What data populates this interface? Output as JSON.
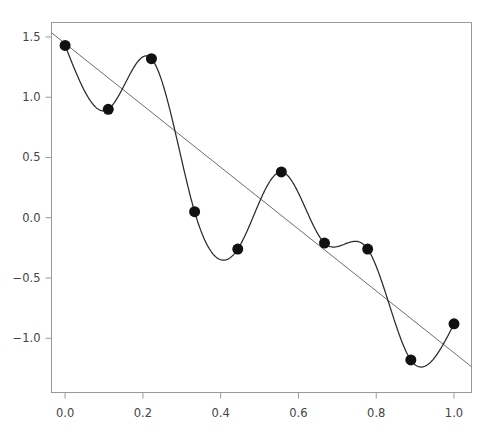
{
  "chart_data": {
    "type": "scatter",
    "title": "",
    "subtitle": "",
    "xlabel": "",
    "ylabel": "",
    "xlim": [
      -0.035,
      1.045
    ],
    "ylim": [
      -1.45,
      1.62
    ],
    "grid": false,
    "legend": false,
    "x_ticks": [
      "0.0",
      "0.2",
      "0.4",
      "0.6",
      "0.8",
      "1.0"
    ],
    "x_tick_values": [
      0.0,
      0.2,
      0.4,
      0.6,
      0.8,
      1.0
    ],
    "y_ticks": [
      "1.5",
      "1.0",
      "0.5",
      "0.0",
      "-0.5",
      "-1.0"
    ],
    "y_tick_values": [
      1.5,
      1.0,
      0.5,
      0.0,
      -0.5,
      -1.0
    ],
    "x": [
      0.0,
      0.111,
      0.222,
      0.333,
      0.444,
      0.556,
      0.667,
      0.778,
      0.889,
      1.0
    ],
    "y": [
      1.43,
      0.9,
      1.32,
      0.05,
      -0.26,
      0.38,
      -0.21,
      -0.26,
      -1.18,
      -0.88
    ],
    "series": [
      {
        "name": "data-points",
        "style": "marker",
        "marker": "filled-circle",
        "marker_size": 11,
        "color": "#111111",
        "x": [
          0.0,
          0.111,
          0.222,
          0.333,
          0.444,
          0.556,
          0.667,
          0.778,
          0.889,
          1.0
        ],
        "values": [
          1.43,
          0.9,
          1.32,
          0.05,
          -0.26,
          0.38,
          -0.21,
          -0.26,
          -1.18,
          -0.88
        ]
      },
      {
        "name": "interpolating-spline",
        "style": "line",
        "color": "#2a2a2a",
        "width": 1.25,
        "description": "smooth cubic spline passing through every data point"
      },
      {
        "name": "linear-regression",
        "style": "line",
        "color": "#6d6d6d",
        "width": 1.0,
        "intercept": 1.445,
        "slope": -2.565,
        "endpoints": [
          [
            -0.035,
            1.535
          ],
          [
            1.045,
            -1.236
          ]
        ]
      }
    ]
  }
}
